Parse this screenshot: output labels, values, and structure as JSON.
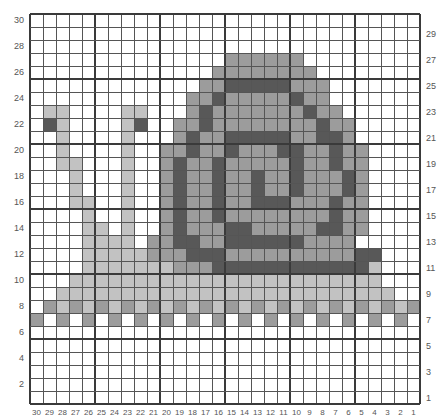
{
  "chart_data": {
    "type": "table",
    "columns": 30,
    "rows": 30,
    "column_labels": [
      30,
      29,
      28,
      27,
      26,
      25,
      24,
      23,
      22,
      21,
      20,
      19,
      18,
      17,
      16,
      15,
      14,
      13,
      12,
      11,
      10,
      9,
      8,
      7,
      6,
      5,
      4,
      3,
      2,
      1
    ],
    "left_row_labels": [
      30,
      28,
      26,
      24,
      22,
      20,
      18,
      16,
      14,
      12,
      10,
      8,
      6,
      4,
      2
    ],
    "right_row_labels": [
      29,
      27,
      25,
      23,
      21,
      19,
      17,
      15,
      13,
      11,
      9,
      7,
      5,
      3,
      1
    ],
    "legend": {
      "0": {
        "name": "white",
        "color": "#ffffff"
      },
      "1": {
        "name": "light-gray",
        "color": "#c2c2c2"
      },
      "2": {
        "name": "medium-gray",
        "color": "#9c9c9c"
      },
      "3": {
        "name": "dark-gray",
        "color": "#585858"
      }
    },
    "grid_rows_top_to_bottom": [
      "000000000000000000000000000000",
      "000000000000000000000000000000",
      "000000000000000000000000000000",
      "000000000000000222222000000000",
      "000000000000002222222200000000",
      "000000000000022333332220000000",
      "000000000000223222223220000000",
      "011000011000232222222322000000",
      "031000013002232222222232200000",
      "001000010002322333332233200000",
      "001000010022322322233223220000",
      "001100010023223222223223220000",
      "000100010023223223223222320000",
      "000100010023223223223222320000",
      "000110010023223223332223220000",
      "000010010023223222222223220000",
      "000011010023222332222233220000",
      "000011110223322333333222200000",
      "000011111222333222222222233000",
      "000011111112223333333333331000",
      "000111111111111111111111111000",
      "001111111111111111111111111100",
      "021212121212121212121212121212",
      "202020202020202020202020202020",
      "000000000000000000000000000000",
      "000000000000000000000000000000",
      "000000000000000000000000000000",
      "000000000000000000000000000000",
      "000000000000000000000000000000",
      "000000000000000000000000000000"
    ],
    "major_grid_every": 5
  }
}
